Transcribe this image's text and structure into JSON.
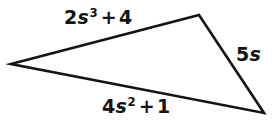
{
  "figure": {
    "kind": "triangle-diagram",
    "background_color": "#ffffff",
    "stroke_color": "#141414",
    "text_color": "#141414",
    "width": 276,
    "height": 128
  },
  "triangle": {
    "name": "scalene-triangle",
    "vertices": [
      {
        "name": "left-vertex",
        "x": 11,
        "y": 64
      },
      {
        "name": "top-right-vertex",
        "x": 199,
        "y": 15
      },
      {
        "name": "bottom-right-vertex",
        "x": 264,
        "y": 113
      }
    ],
    "points_attr": "11,64 199,15 264,113"
  },
  "labels": {
    "top": {
      "name": "top-side-label",
      "text": "2s³ + 4",
      "coefficient": "2",
      "variable": "s",
      "exponent": "3",
      "operator": "+",
      "constant": "4"
    },
    "right": {
      "name": "right-side-label",
      "text": "5s",
      "coefficient": "5",
      "variable": "s"
    },
    "bottom": {
      "name": "bottom-side-label",
      "text": "4s² + 1",
      "coefficient": "4",
      "variable": "s",
      "exponent": "2",
      "operator": "+",
      "constant": "1"
    }
  }
}
